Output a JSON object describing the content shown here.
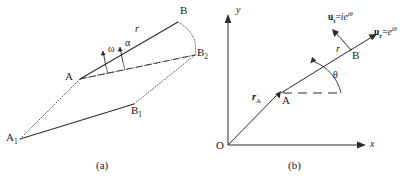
{
  "figure": {
    "panels": [
      {
        "id": "a",
        "caption": "(a)",
        "points": [
          {
            "name": "A1",
            "label": "A",
            "sub": "1",
            "x": 20,
            "y": 139,
            "lx": 7,
            "ly": 139
          },
          {
            "name": "A",
            "label": "A",
            "sub": "",
            "x": 80,
            "y": 79,
            "lx": 68,
            "ly": 72
          },
          {
            "name": "B",
            "label": "B",
            "sub": "",
            "x": 178,
            "y": 22,
            "lx": 181,
            "ly": 8
          },
          {
            "name": "B1",
            "label": "B",
            "sub": "1",
            "x": 134,
            "y": 104,
            "lx": 133,
            "ly": 106
          },
          {
            "name": "B2",
            "label": "B",
            "sub": "2",
            "x": 195,
            "y": 55,
            "lx": 197,
            "ly": 51
          }
        ],
        "labels": {
          "r": "r",
          "omega": "ω",
          "alpha": "α"
        }
      },
      {
        "id": "b",
        "caption": "(b)",
        "axes": {
          "x_label": "x",
          "y_label": "y",
          "origin_label": "O"
        },
        "points": [
          {
            "name": "A",
            "label": "A",
            "x": 281,
            "y": 93
          },
          {
            "name": "B",
            "label": "B",
            "x": 350,
            "y": 50
          }
        ],
        "labels": {
          "r": "r",
          "rA_symbol": "r",
          "rA_sub": "A",
          "theta": "θ",
          "ut_bold": "u",
          "ut_sub": "t",
          "ut_eq": "=",
          "ut_i": "i",
          "ut_e": "e",
          "ut_exp": "iθ",
          "ur_bold": "u",
          "ur_sub": "r",
          "ur_eq": "=",
          "ur_e": "e",
          "ur_exp": "iθ"
        }
      }
    ],
    "colors": {
      "stroke": "#2b2b2b",
      "background": "#ffffff"
    }
  }
}
